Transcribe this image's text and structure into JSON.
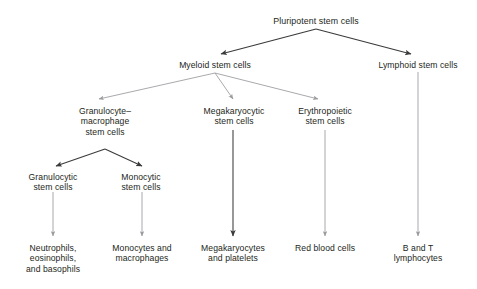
{
  "diagram": {
    "title": "Pluripotent stem cells",
    "type": "hierarchy-flowchart",
    "background_color": "#ffffff",
    "text_color": "#231f20",
    "arrow_color_dark": "#3a3a3c",
    "arrow_color_light": "#9a9a9e",
    "nodes": [
      {
        "id": "pluripotent",
        "label": "Pluripotent stem cells",
        "lines": [
          "Pluripotent stem cells"
        ],
        "x": 316,
        "y": 16,
        "level": 0
      },
      {
        "id": "myeloid",
        "label": "Myeloid stem cells",
        "lines": [
          "Myeloid stem cells"
        ],
        "x": 215,
        "y": 60,
        "level": 1
      },
      {
        "id": "lymphoid",
        "label": "Lymphoid stem cells",
        "lines": [
          "Lymphoid stem cells"
        ],
        "x": 418,
        "y": 60,
        "level": 1
      },
      {
        "id": "granulocyte-macrophage",
        "label": "Granulocyte–macrophage stem cells",
        "lines": [
          "Granulocyte–",
          "macrophage",
          "stem cells"
        ],
        "x": 105,
        "y": 106,
        "level": 2
      },
      {
        "id": "megakaryocytic",
        "label": "Megakaryocytic stem cells",
        "lines": [
          "Megakaryocytic",
          "stem cells"
        ],
        "x": 234,
        "y": 106,
        "level": 2
      },
      {
        "id": "erythropoietic",
        "label": "Erythropoietic stem cells",
        "lines": [
          "Erythropoietic",
          "stem cells"
        ],
        "x": 325,
        "y": 106,
        "level": 2
      },
      {
        "id": "granulocytic",
        "label": "Granulocytic stem cells",
        "lines": [
          "Granulocytic",
          "stem cells"
        ],
        "x": 53,
        "y": 172,
        "level": 3
      },
      {
        "id": "monocytic",
        "label": "Monocytic stem cells",
        "lines": [
          "Monocytic",
          "stem cells"
        ],
        "x": 141,
        "y": 172,
        "level": 3
      },
      {
        "id": "neutrophils",
        "label": "Neutrophils, eosinophils, and basophils",
        "lines": [
          "Neutrophils,",
          "eosinophils,",
          "and basophils"
        ],
        "x": 53,
        "y": 243,
        "level": 4
      },
      {
        "id": "monocytes",
        "label": "Monocytes and macrophages",
        "lines": [
          "Monocytes and",
          "macrophages"
        ],
        "x": 142,
        "y": 243,
        "level": 4
      },
      {
        "id": "megakaryocytes",
        "label": "Megakaryocytes and platelets",
        "lines": [
          "Megakaryocytes",
          "and platelets"
        ],
        "x": 233,
        "y": 243,
        "level": 4
      },
      {
        "id": "red-blood-cells",
        "label": "Red blood cells",
        "lines": [
          "Red blood cells"
        ],
        "x": 325,
        "y": 243,
        "level": 4
      },
      {
        "id": "b-and-t",
        "label": "B and T lymphocytes",
        "lines": [
          "B and T",
          "lymphocytes"
        ],
        "x": 418,
        "y": 243,
        "level": 4
      }
    ],
    "edges": [
      {
        "id": "pluripotent-to-myeloid",
        "from": "pluripotent",
        "to": "myeloid",
        "style": "dark",
        "x1": 316,
        "y1": 29,
        "x2": 221,
        "y2": 54
      },
      {
        "id": "pluripotent-to-lymphoid",
        "from": "pluripotent",
        "to": "lymphoid",
        "style": "dark",
        "x1": 316,
        "y1": 29,
        "x2": 411,
        "y2": 54
      },
      {
        "id": "myeloid-to-granulocyte-macrophage",
        "from": "myeloid",
        "to": "granulocyte-macrophage",
        "style": "light",
        "x1": 215,
        "y1": 73,
        "x2": 99,
        "y2": 99
      },
      {
        "id": "myeloid-to-megakaryocytic",
        "from": "myeloid",
        "to": "megakaryocytic",
        "style": "light",
        "x1": 215,
        "y1": 73,
        "x2": 233,
        "y2": 99
      },
      {
        "id": "myeloid-to-erythropoietic",
        "from": "myeloid",
        "to": "erythropoietic",
        "style": "light",
        "x1": 215,
        "y1": 73,
        "x2": 318,
        "y2": 99
      },
      {
        "id": "granulocyte-macrophage-to-granulocytic",
        "from": "granulocyte-macrophage",
        "to": "granulocytic",
        "style": "dark",
        "x1": 105,
        "y1": 149,
        "x2": 56,
        "y2": 166
      },
      {
        "id": "granulocyte-macrophage-to-monocytic",
        "from": "granulocyte-macrophage",
        "to": "monocytic",
        "style": "dark",
        "x1": 105,
        "y1": 149,
        "x2": 142,
        "y2": 166
      },
      {
        "id": "granulocytic-to-neutrophils",
        "from": "granulocytic",
        "to": "neutrophils",
        "style": "light",
        "x1": 53,
        "y1": 192,
        "x2": 53,
        "y2": 236
      },
      {
        "id": "monocytic-to-monocytes",
        "from": "monocytic",
        "to": "monocytes",
        "style": "light",
        "x1": 142,
        "y1": 192,
        "x2": 142,
        "y2": 236
      },
      {
        "id": "megakaryocytic-to-megakaryocytes",
        "from": "megakaryocytic",
        "to": "megakaryocytes",
        "style": "dark",
        "x1": 233,
        "y1": 130,
        "x2": 233,
        "y2": 236
      },
      {
        "id": "erythropoietic-to-red-blood-cells",
        "from": "erythropoietic",
        "to": "red-blood-cells",
        "style": "light",
        "x1": 325,
        "y1": 130,
        "x2": 325,
        "y2": 236
      },
      {
        "id": "lymphoid-to-b-and-t",
        "from": "lymphoid",
        "to": "b-and-t",
        "style": "light",
        "x1": 418,
        "y1": 72,
        "x2": 418,
        "y2": 236
      }
    ]
  }
}
